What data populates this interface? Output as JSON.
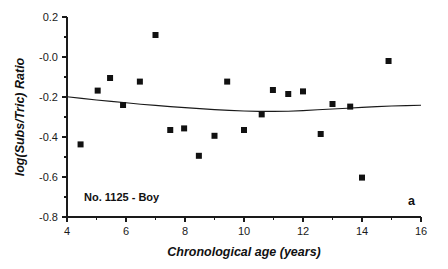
{
  "chart_data": {
    "type": "scatter",
    "title": "",
    "xlabel": "Chronological age (years)",
    "ylabel": "log(Subs/Tric) Ratio",
    "xlim": [
      4,
      16
    ],
    "ylim": [
      -0.8,
      0.2
    ],
    "xticks": [
      4,
      6,
      8,
      10,
      12,
      14,
      16
    ],
    "xtick_labels": [
      "4",
      "6",
      "8",
      "10",
      "12",
      "14",
      "16"
    ],
    "xminor_ticks": [
      5,
      7,
      9,
      11,
      13,
      15
    ],
    "yticks": [
      0.2,
      -0.0,
      -0.2,
      -0.4,
      -0.6,
      -0.8
    ],
    "ytick_labels": [
      "0.2",
      "-0.0",
      "-0.2",
      "-0.4",
      "-0.6",
      "-0.8"
    ],
    "yminor_ticks": [
      0.1,
      -0.1,
      -0.3,
      -0.5,
      -0.7
    ],
    "grid": false,
    "legend": "none",
    "series": [
      {
        "name": "Subscapular / Triceps ratio",
        "marker": "square",
        "marker_color": "#111111",
        "points": [
          {
            "x": 4.46,
            "y": -0.437
          },
          {
            "x": 5.04,
            "y": -0.168
          },
          {
            "x": 5.46,
            "y": -0.105
          },
          {
            "x": 5.9,
            "y": -0.24
          },
          {
            "x": 6.47,
            "y": -0.123
          },
          {
            "x": 7.0,
            "y": 0.11
          },
          {
            "x": 7.5,
            "y": -0.365
          },
          {
            "x": 7.97,
            "y": -0.357
          },
          {
            "x": 8.47,
            "y": -0.494
          },
          {
            "x": 9.0,
            "y": -0.394
          },
          {
            "x": 9.43,
            "y": -0.123
          },
          {
            "x": 10.0,
            "y": -0.365
          },
          {
            "x": 10.6,
            "y": -0.287
          },
          {
            "x": 10.98,
            "y": -0.165
          },
          {
            "x": 11.5,
            "y": -0.185
          },
          {
            "x": 12.0,
            "y": -0.172
          },
          {
            "x": 12.6,
            "y": -0.385
          },
          {
            "x": 13.0,
            "y": -0.235
          },
          {
            "x": 13.6,
            "y": -0.248
          },
          {
            "x": 14.0,
            "y": -0.603
          },
          {
            "x": 14.9,
            "y": -0.02
          }
        ]
      }
    ],
    "fit_curve": {
      "name": "fitted polynomial curve",
      "color": "#1a1a1a",
      "points": [
        {
          "x": 4.0,
          "y": -0.199
        },
        {
          "x": 4.5,
          "y": -0.207
        },
        {
          "x": 5.0,
          "y": -0.215
        },
        {
          "x": 5.5,
          "y": -0.222
        },
        {
          "x": 6.0,
          "y": -0.229
        },
        {
          "x": 6.5,
          "y": -0.236
        },
        {
          "x": 7.0,
          "y": -0.242
        },
        {
          "x": 7.5,
          "y": -0.248
        },
        {
          "x": 8.0,
          "y": -0.253
        },
        {
          "x": 8.5,
          "y": -0.258
        },
        {
          "x": 9.0,
          "y": -0.263
        },
        {
          "x": 9.5,
          "y": -0.267
        },
        {
          "x": 10.0,
          "y": -0.27
        },
        {
          "x": 10.5,
          "y": -0.272
        },
        {
          "x": 11.0,
          "y": -0.272
        },
        {
          "x": 11.5,
          "y": -0.271
        },
        {
          "x": 12.0,
          "y": -0.268
        },
        {
          "x": 12.5,
          "y": -0.264
        },
        {
          "x": 13.0,
          "y": -0.26
        },
        {
          "x": 13.5,
          "y": -0.256
        },
        {
          "x": 14.0,
          "y": -0.252
        },
        {
          "x": 14.5,
          "y": -0.248
        },
        {
          "x": 15.0,
          "y": -0.245
        },
        {
          "x": 15.5,
          "y": -0.243
        },
        {
          "x": 16.0,
          "y": -0.241
        }
      ]
    },
    "annotations": [
      {
        "id": "subject-label",
        "text": "No. 1125 - Boy",
        "x": 4.6,
        "y": -0.715
      },
      {
        "id": "panel-label",
        "text": "a",
        "x": 15.7,
        "y": -0.73
      }
    ]
  }
}
